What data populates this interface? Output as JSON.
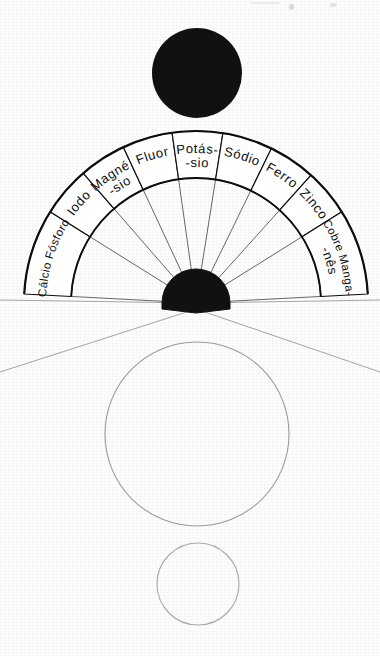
{
  "figure": {
    "language": "pt",
    "background_color": "#fdfdfc",
    "ink_color": "#0d0d0d",
    "faint_ink_color": "#9a9a9a",
    "hub": {
      "name": "black-hub",
      "fill": "#111111",
      "center_x": 196,
      "center_y": 303,
      "radius": 34,
      "notch_depth": 14
    },
    "ring": {
      "center_x": 196,
      "center_y": 303,
      "outer_radius": 172,
      "inner_radius": 125,
      "spoke_inner_radius": 34,
      "start_angle_deg": 183,
      "end_angle_deg": 357
    },
    "sectors": [
      {
        "id": "calcio-fosforo",
        "label": "Cálcio Fósforo",
        "lines": [
          "Cálcio Fósforo"
        ],
        "start_deg": 183,
        "end_deg": 212,
        "label_radius": 150
      },
      {
        "id": "iodo",
        "label": "Iodo",
        "lines": [
          "Iodo"
        ],
        "start_deg": 212,
        "end_deg": 229,
        "label_radius": 150
      },
      {
        "id": "magnesio",
        "label": "Magné- -sio",
        "lines": [
          "Magné-",
          "-sio"
        ],
        "start_deg": 229,
        "end_deg": 245,
        "label_radius": 150
      },
      {
        "id": "fluor",
        "label": "Fluor",
        "lines": [
          "Fluor"
        ],
        "start_deg": 245,
        "end_deg": 262,
        "label_radius": 150
      },
      {
        "id": "potassio",
        "label": "Potás- -sio",
        "lines": [
          "Potás-",
          "-sio"
        ],
        "start_deg": 262,
        "end_deg": 279,
        "label_radius": 150
      },
      {
        "id": "sodio",
        "label": "Sódio",
        "lines": [
          "Sódio"
        ],
        "start_deg": 279,
        "end_deg": 296,
        "label_radius": 150
      },
      {
        "id": "ferro",
        "label": "Ferro",
        "lines": [
          "Ferro"
        ],
        "start_deg": 296,
        "end_deg": 312,
        "label_radius": 150
      },
      {
        "id": "zinco",
        "label": "Zinco",
        "lines": [
          "Zinco"
        ],
        "start_deg": 312,
        "end_deg": 328,
        "label_radius": 150
      },
      {
        "id": "cobre-manganes",
        "label": "Cobre Manga- -nês",
        "lines": [
          "Cobre Manga-",
          "-nês"
        ],
        "start_deg": 328,
        "end_deg": 357,
        "label_radius": 150
      }
    ],
    "circles": [
      {
        "id": "top-solid-circle",
        "name": "solid-black-circle",
        "cx": 197,
        "cy": 73,
        "r": 45,
        "fill": "#111111",
        "stroke": "none"
      },
      {
        "id": "large-open-circle",
        "name": "large-outline-circle",
        "cx": 197,
        "cy": 434,
        "r": 92,
        "fill": "none",
        "stroke": "#9a9a9a"
      },
      {
        "id": "small-open-circle",
        "name": "small-outline-circle",
        "cx": 198,
        "cy": 584,
        "r": 41,
        "fill": "none",
        "stroke": "#a8a8a8"
      }
    ],
    "guide_lines": [
      {
        "id": "left-horizon",
        "x1": 0,
        "y1": 300,
        "x2": 196,
        "y2": 303
      },
      {
        "id": "right-horizon",
        "x1": 196,
        "y1": 303,
        "x2": 380,
        "y2": 300
      },
      {
        "id": "left-diagonal",
        "x1": 0,
        "y1": 372,
        "x2": 196,
        "y2": 309
      },
      {
        "id": "right-diagonal",
        "x1": 196,
        "y1": 309,
        "x2": 380,
        "y2": 372
      }
    ]
  }
}
